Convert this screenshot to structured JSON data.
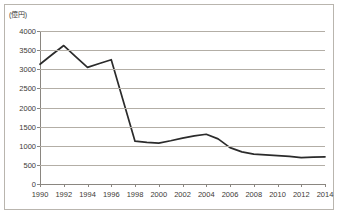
{
  "chart": {
    "unit_label": "(億円)",
    "line_color": "#2b2b2b",
    "grid_color": "#b3aea6",
    "axis_color": "#8a8680",
    "border_color": "#b9b5ae",
    "background": "#ffffff"
  },
  "chart_data": {
    "type": "line",
    "title": "",
    "xlabel": "",
    "ylabel": "(億円)",
    "ylim": [
      0,
      4000
    ],
    "xlim": [
      1990,
      2014
    ],
    "grid": true,
    "legend": false,
    "yticks": [
      0,
      500,
      1000,
      1500,
      2000,
      2500,
      3000,
      3500,
      4000
    ],
    "ytick_labels": [
      "0",
      "500",
      "1000",
      "1500",
      "2000",
      "2500",
      "3000",
      "3500",
      "4000"
    ],
    "xticks": [
      1990,
      1992,
      1994,
      1996,
      1998,
      2000,
      2002,
      2004,
      2006,
      2008,
      2010,
      2012,
      2014
    ],
    "xtick_labels": [
      "1990",
      "1992",
      "1994",
      "1996",
      "1998",
      "2000",
      "2002",
      "2004",
      "2006",
      "2008",
      "2010",
      "2012",
      "2014"
    ],
    "x": [
      1990,
      1991,
      1992,
      1993,
      1994,
      1995,
      1996,
      1997,
      1998,
      1999,
      2000,
      2001,
      2002,
      2003,
      2004,
      2005,
      2006,
      2007,
      2008,
      2009,
      2010,
      2011,
      2012,
      2013,
      2014
    ],
    "values": [
      3130,
      3380,
      3620,
      3330,
      3050,
      3150,
      3250,
      2180,
      1120,
      1090,
      1070,
      1130,
      1200,
      1260,
      1300,
      1180,
      950,
      840,
      780,
      760,
      740,
      720,
      690,
      700,
      710
    ],
    "series": [
      {
        "name": "",
        "values": [
          3130,
          3380,
          3620,
          3330,
          3050,
          3150,
          3250,
          2180,
          1120,
          1090,
          1070,
          1130,
          1200,
          1260,
          1300,
          1180,
          950,
          840,
          780,
          760,
          740,
          720,
          690,
          700,
          710
        ]
      }
    ]
  }
}
